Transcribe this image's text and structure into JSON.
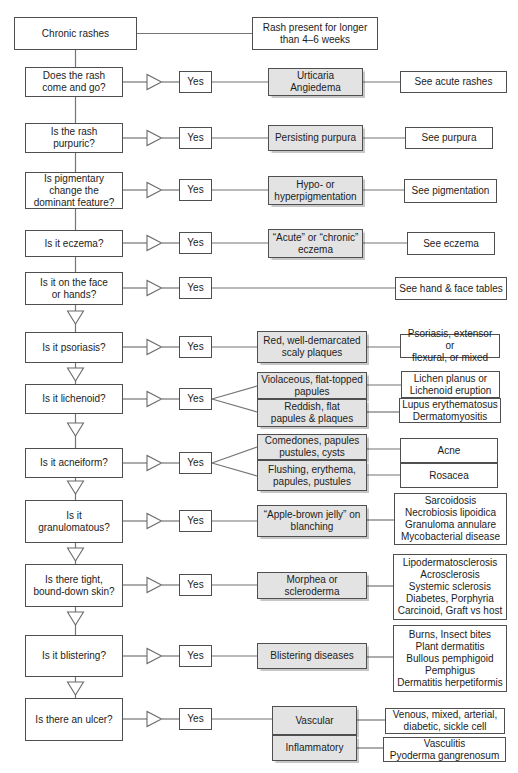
{
  "colors": {
    "shaded_box_fill": "#e3e3e3",
    "box_border": "#4f4f4f",
    "line": "#757575"
  },
  "start": {
    "label": "Chronic rashes"
  },
  "definition": {
    "label": "Rash present for longer\nthan 4–6 weeks"
  },
  "yes_label": "Yes",
  "rows": [
    {
      "question": "Does the rash\ncome and go?",
      "middles": [
        "Urticaria\nAngiedema"
      ],
      "results": [
        "See acute rashes"
      ]
    },
    {
      "question": "Is the rash\npurpuric?",
      "middles": [
        "Persisting purpura"
      ],
      "results": [
        "See purpura"
      ]
    },
    {
      "question": "Is pigmentary\nchange the\ndominant feature?",
      "middles": [
        "Hypo- or\nhyperpigmentation"
      ],
      "results": [
        "See pigmentation"
      ]
    },
    {
      "question": "Is it eczema?",
      "middles": [
        "“Acute” or “chronic”\neczema"
      ],
      "results": [
        "See eczema"
      ]
    },
    {
      "question": "Is it on the face\nor hands?",
      "middles": [],
      "results": [
        "See hand & face tables"
      ]
    },
    {
      "question": "Is it psoriasis?",
      "middles": [
        "Red, well-demarcated\nscaly plaques"
      ],
      "results": [
        "Psoriasis, extensor or\nflexural, or mixed"
      ]
    },
    {
      "question": "Is it lichenoid?",
      "middles": [
        "Violaceous, flat-topped\npapules",
        "Reddish, flat\npapules & plaques"
      ],
      "results": [
        "Lichen planus or\nLichenoid eruption",
        "Lupus erythematosus\nDermatomyositis"
      ]
    },
    {
      "question": "Is it acneiform?",
      "middles": [
        "Comedones, papules\npustules, cysts",
        "Flushing, erythema,\npapules, pustules"
      ],
      "results": [
        "Acne",
        "Rosacea"
      ]
    },
    {
      "question": "Is it\ngranulomatous?",
      "middles": [
        "“Apple-brown jelly” on\nblanching"
      ],
      "results": [
        "Sarcoidosis\nNecrobiosis lipoidica\nGranuloma annulare\nMycobacterial disease"
      ]
    },
    {
      "question": "Is there tight,\nbound-down skin?",
      "middles": [
        "Morphea or\nscleroderma"
      ],
      "results": [
        "Lipodermatosclerosis\nAcrosclerosis\nSystemic sclerosis\nDiabetes, Porphyria\nCarcinoid, Graft vs host"
      ]
    },
    {
      "question": "Is it blistering?",
      "middles": [
        "Blistering diseases"
      ],
      "results": [
        "Burns, Insect bites\nPlant dermatitis\nBullous pemphigoid\nPemphigus\nDermatitis herpetiformis"
      ]
    },
    {
      "question": "Is there an ulcer?",
      "middles": [
        "Vascular",
        "Inflammatory"
      ],
      "results": [
        "Venous, mixed, arterial,\ndiabetic, sickle cell",
        "Vasculitis\nPyoderma gangrenosum"
      ]
    }
  ]
}
